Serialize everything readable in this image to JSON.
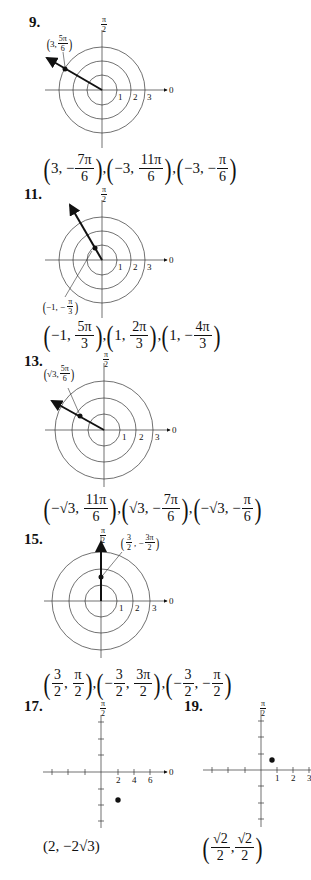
{
  "problems": [
    {
      "number": "9.",
      "type": "polar",
      "plot_label": {
        "open": "(",
        "r": "3,",
        "theta_num": "5π",
        "theta_den": "6",
        "close": ")"
      },
      "axis_top_label": {
        "num": "π",
        "den": "2"
      },
      "axis_right_label": "0",
      "ticks": [
        "1",
        "2",
        "3"
      ],
      "answers": [
        {
          "r": "3,",
          "sign": "−",
          "num": "7π",
          "den": "6"
        },
        {
          "r": "−3,",
          "sign": "",
          "num": "11π",
          "den": "6"
        },
        {
          "r": "−3,",
          "sign": "−",
          "num": "π",
          "den": "6"
        }
      ],
      "separator": ","
    },
    {
      "number": "11.",
      "type": "polar",
      "plot_label": {
        "open": "(",
        "r": "−1,",
        "theta_sign": "−",
        "theta_num": "π",
        "theta_den": "3",
        "close": ")"
      },
      "axis_top_label": {
        "num": "π",
        "den": "2"
      },
      "axis_right_label": "0",
      "ticks": [
        "1",
        "2",
        "3"
      ],
      "answers": [
        {
          "r": "−1,",
          "sign": "",
          "num": "5π",
          "den": "3"
        },
        {
          "r": "1,",
          "sign": "",
          "num": "2π",
          "den": "3"
        },
        {
          "r": "1,",
          "sign": "−",
          "num": "4π",
          "den": "3"
        }
      ],
      "separator": ","
    },
    {
      "number": "13.",
      "type": "polar",
      "plot_label": {
        "open": "(",
        "r": "√3,",
        "theta_num": "5π",
        "theta_den": "6",
        "close": ")"
      },
      "axis_top_label": {
        "num": "π",
        "den": "2"
      },
      "axis_right_label": "0",
      "ticks": [
        "1",
        "2",
        "3"
      ],
      "answers": [
        {
          "r": "−√3,",
          "sign": "",
          "num": "11π",
          "den": "6"
        },
        {
          "r": "√3,",
          "sign": "−",
          "num": "7π",
          "den": "6"
        },
        {
          "r": "−√3,",
          "sign": "−",
          "num": "π",
          "den": "6"
        }
      ],
      "separator": ","
    },
    {
      "number": "15.",
      "type": "polar",
      "plot_label": {
        "open": "(",
        "r_num": "3",
        "r_den": "2",
        "theta_sign": "−",
        "theta_num": "3π",
        "theta_den": "2",
        "close": ")"
      },
      "axis_top_label": {
        "num": "π",
        "den": "2"
      },
      "axis_right_label": "0",
      "ticks": [
        "1",
        "2",
        "3"
      ],
      "answers": [
        {
          "r_sign": "",
          "r_num": "3",
          "r_den": "2",
          "sign": "",
          "num": "π",
          "den": "2"
        },
        {
          "r_sign": "−",
          "r_num": "3",
          "r_den": "2",
          "sign": "",
          "num": "3π",
          "den": "2"
        },
        {
          "r_sign": "−",
          "r_num": "3",
          "r_den": "2",
          "sign": "−",
          "num": "π",
          "den": "2"
        }
      ],
      "separator": ","
    },
    {
      "number": "17.",
      "type": "rect",
      "axis_top_label": {
        "num": "π",
        "den": "2"
      },
      "axis_right_label": "0",
      "ticks": [
        "2",
        "4",
        "6"
      ],
      "point": {
        "x": 2,
        "y": -3.46
      },
      "answer": {
        "text": "(2, −2√3)"
      }
    },
    {
      "number": "19.",
      "type": "rect",
      "axis_top_label": {
        "num": "π",
        "den": "2"
      },
      "axis_right_label": "0",
      "ticks": [
        "1",
        "2",
        "3"
      ],
      "point": {
        "x": 0.707,
        "y": 0.707
      },
      "answer": {
        "x_num": "√2",
        "x_den": "2",
        "y_num": "√2",
        "y_den": "2"
      }
    }
  ]
}
